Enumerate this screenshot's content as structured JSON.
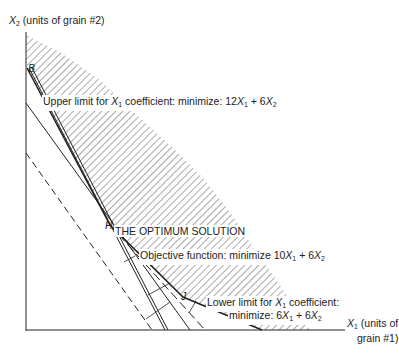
{
  "axes": {
    "y_label_var": "X",
    "y_label_sub": "2",
    "y_label_text": "(units of grain #2)",
    "x_label_var": "X",
    "x_label_sub": "1",
    "x_label_text_line1": "(units of",
    "x_label_text_line2": "grain #1)"
  },
  "points": {
    "B": "B",
    "H": "H",
    "J": "J"
  },
  "labels": {
    "upper_limit": {
      "prefix": "Upper limit for ",
      "var": "X",
      "sub": "1",
      "middle": " coefficient: minimize: 12",
      "var2": "X",
      "sub2": "1",
      "plus": " + 6",
      "var3": "X",
      "sub3": "2"
    },
    "optimum": "THE OPTIMUM SOLUTION",
    "objective": {
      "prefix": "Objective function: minimize 10",
      "var": "X",
      "sub": "1",
      "plus": " + 6",
      "var2": "X",
      "sub2": "2"
    },
    "lower_limit": {
      "line1_prefix": "Lower limit for ",
      "line1_var": "X",
      "line1_sub": "1",
      "line1_suffix": " coefficient:",
      "line2_prefix": "minimize: 6",
      "line2_var": "X",
      "line2_sub": "1",
      "line2_plus": " + 6",
      "line2_var2": "X",
      "line2_sub2": "2"
    }
  },
  "colors": {
    "ink": "#222222",
    "hatch": "#555555",
    "background": "#ffffff"
  }
}
